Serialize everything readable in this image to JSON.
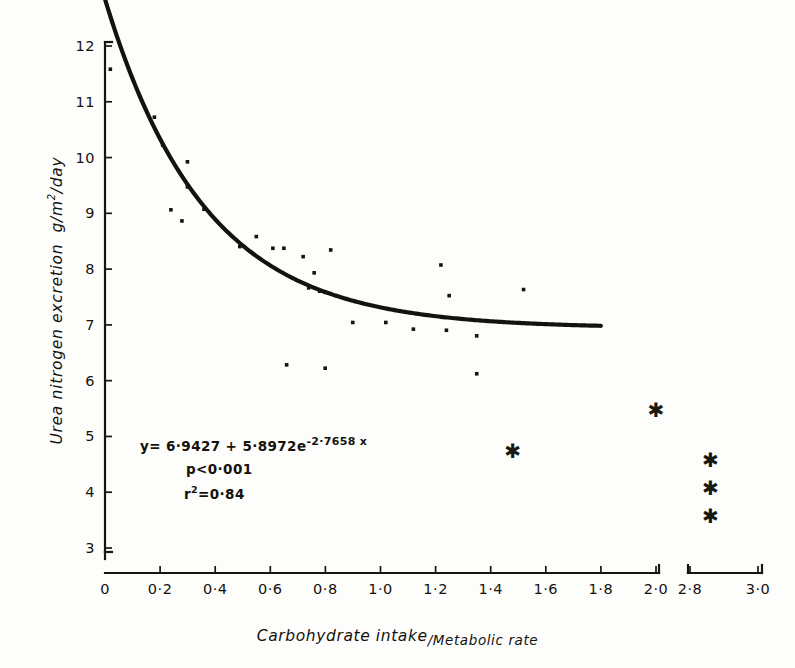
{
  "chart_data": {
    "type": "scatter",
    "title": "",
    "xlabel_numerator": "Carbohydrate intake",
    "xlabel_denominator": "/Metabolic rate",
    "xlabel": "Carbohydrate intake/Metabolic rate",
    "ylabel": "Urea nitrogen excretion  g/m2/day",
    "ylabel_main": "Urea nitrogen excretion",
    "ylabel_units": "g/m",
    "ylabel_units_sup": "2",
    "ylabel_units_tail": "/day",
    "xlim": [
      0,
      3.0
    ],
    "ylim": [
      3,
      12
    ],
    "axis_break": {
      "present": true,
      "after": "2·0",
      "resume": "2·8"
    },
    "grid": false,
    "legend": "none",
    "xticks": [
      "0",
      "0·2",
      "0·4",
      "0·6",
      "0·8",
      "1·0",
      "1·2",
      "1·4",
      "1·6",
      "1·8",
      "2·0",
      "2·8",
      "3·0"
    ],
    "xtick_values": [
      0,
      0.2,
      0.4,
      0.6,
      0.8,
      1.0,
      1.2,
      1.4,
      1.6,
      1.8,
      2.0,
      2.8,
      3.0
    ],
    "yticks": [
      "12",
      "11",
      "10",
      "9",
      "8",
      "7",
      "6",
      "5",
      "4",
      "3"
    ],
    "ytick_values": [
      12,
      11,
      10,
      9,
      8,
      7,
      6,
      5,
      4,
      3
    ],
    "series": [
      {
        "name": "observations",
        "marker": "dot",
        "points": [
          {
            "x": 0.02,
            "y": 11.58
          },
          {
            "x": 0.18,
            "y": 10.72
          },
          {
            "x": 0.21,
            "y": 10.22
          },
          {
            "x": 0.3,
            "y": 9.92
          },
          {
            "x": 0.3,
            "y": 9.47
          },
          {
            "x": 0.24,
            "y": 9.06
          },
          {
            "x": 0.28,
            "y": 8.86
          },
          {
            "x": 0.36,
            "y": 9.07
          },
          {
            "x": 0.49,
            "y": 8.4
          },
          {
            "x": 0.55,
            "y": 8.58
          },
          {
            "x": 0.61,
            "y": 8.37
          },
          {
            "x": 0.65,
            "y": 8.37
          },
          {
            "x": 0.72,
            "y": 8.22
          },
          {
            "x": 0.76,
            "y": 7.93
          },
          {
            "x": 0.74,
            "y": 7.66
          },
          {
            "x": 0.78,
            "y": 7.6
          },
          {
            "x": 0.8,
            "y": 7.58
          },
          {
            "x": 0.84,
            "y": 7.52
          },
          {
            "x": 0.82,
            "y": 8.34
          },
          {
            "x": 0.66,
            "y": 6.28
          },
          {
            "x": 0.8,
            "y": 6.22
          },
          {
            "x": 0.9,
            "y": 7.04
          },
          {
            "x": 1.02,
            "y": 7.04
          },
          {
            "x": 1.12,
            "y": 6.92
          },
          {
            "x": 1.22,
            "y": 8.07
          },
          {
            "x": 1.25,
            "y": 7.52
          },
          {
            "x": 1.24,
            "y": 6.9
          },
          {
            "x": 1.35,
            "y": 6.8
          },
          {
            "x": 1.35,
            "y": 6.12
          },
          {
            "x": 1.52,
            "y": 7.63
          }
        ]
      },
      {
        "name": "excluded-observations",
        "marker": "asterisk",
        "points": [
          {
            "x": 1.48,
            "y": 4.72
          },
          {
            "x": 2.0,
            "y": 5.45
          },
          {
            "x": 2.86,
            "y": 4.55
          },
          {
            "x": 2.86,
            "y": 4.05
          },
          {
            "x": 2.86,
            "y": 3.55
          }
        ]
      }
    ],
    "fit_curve": {
      "name": "exponential-fit",
      "equation_display": "y= 6·9427 + 5·8972e",
      "equation_exponent": "-2·7658 x",
      "intercept": 6.9427,
      "amplitude": 5.8972,
      "rate": -2.7658,
      "x_start": 0.0,
      "x_end": 1.8
    },
    "annotations": [
      {
        "id": "equation",
        "text": "y= 6·9427 + 5·8972e",
        "exponent": "-2·7658 x"
      },
      {
        "id": "p-value",
        "text": "p<0·001"
      },
      {
        "id": "r-squared",
        "text_prefix": "r",
        "text_sup": "2",
        "text_suffix": "=0·84",
        "text": "r2=0·84"
      }
    ]
  },
  "colors": {
    "ink": "#14120d",
    "background": "#fdfdfc",
    "marker": "#16140f"
  }
}
